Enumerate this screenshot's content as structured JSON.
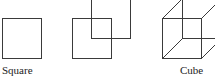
{
  "figures": [
    {
      "name": "square",
      "label": "Square"
    },
    {
      "name": "two-offset-squares",
      "label": ""
    },
    {
      "name": "cube",
      "label": "Cube"
    }
  ],
  "colors": {
    "stroke": "#3a3a3a",
    "background": "#ffffff"
  }
}
